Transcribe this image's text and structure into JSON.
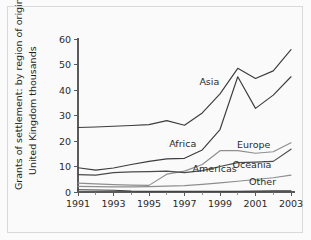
{
  "chart_data": {
    "type": "line",
    "title": "",
    "ylabel_lines": [
      "Grants of settlement: by region of origin",
      "United Kingdom thousands"
    ],
    "xlabel": "",
    "x": [
      1991,
      1992,
      1993,
      1994,
      1995,
      1996,
      1997,
      1998,
      1999,
      2000,
      2001,
      2002,
      2003
    ],
    "xlim": [
      1991,
      2003
    ],
    "ylim": [
      0,
      60
    ],
    "yticks": [
      0,
      10,
      20,
      30,
      40,
      50,
      60
    ],
    "xticks_major": [
      1991,
      1993,
      1995,
      1997,
      1999,
      2001,
      2003
    ],
    "xticks_minor": [
      1992,
      1994,
      1996,
      1998,
      2000,
      2002
    ],
    "grid": false,
    "legend_position": "inline-labels",
    "series": [
      {
        "name": "Asia",
        "color": "#3c3c3c",
        "label_x": 1998.4,
        "label_y": 42.0,
        "values": [
          25.3,
          25.5,
          25.8,
          26.1,
          26.4,
          28.0,
          26.2,
          31.0,
          38.5,
          48.5,
          44.5,
          47.5,
          55.8
        ]
      },
      {
        "name": "Africa",
        "color": "#3c3c3c",
        "label_x": 1996.9,
        "label_y": 17.8,
        "values": [
          9.5,
          8.6,
          9.4,
          10.8,
          12.0,
          13.0,
          13.2,
          16.5,
          24.5,
          45.2,
          32.8,
          38.0,
          45.2
        ]
      },
      {
        "name": "Europe",
        "color": "#8e8e8e",
        "label_x": 2000.9,
        "label_y": 17.2,
        "values": [
          3.5,
          3.2,
          2.9,
          2.7,
          2.6,
          7.0,
          8.2,
          10.8,
          16.2,
          16.2,
          15.2,
          15.8,
          19.3
        ]
      },
      {
        "name": "Americas",
        "color": "#4a4a4a",
        "label_x": 1998.7,
        "label_y": 8.0,
        "values": [
          6.8,
          6.6,
          7.6,
          7.9,
          8.0,
          8.2,
          7.6,
          8.4,
          10.0,
          11.5,
          11.7,
          12.0,
          16.8
        ]
      },
      {
        "name": "Oceania",
        "color": "#8e8e8e",
        "label_x": 2000.8,
        "label_y": 9.5,
        "values": [
          2.2,
          2.1,
          2.0,
          2.0,
          2.1,
          2.3,
          2.5,
          3.0,
          3.6,
          4.2,
          4.9,
          5.6,
          6.6
        ]
      },
      {
        "name": "Other",
        "color": "#3c3c3c",
        "label_x": 2001.4,
        "label_y": 2.6,
        "values": [
          0.9,
          0.8,
          0.7,
          0.4,
          0.3,
          0.3,
          0.3,
          0.3,
          0.3,
          0.3,
          0.4,
          0.5,
          0.5
        ]
      }
    ]
  }
}
